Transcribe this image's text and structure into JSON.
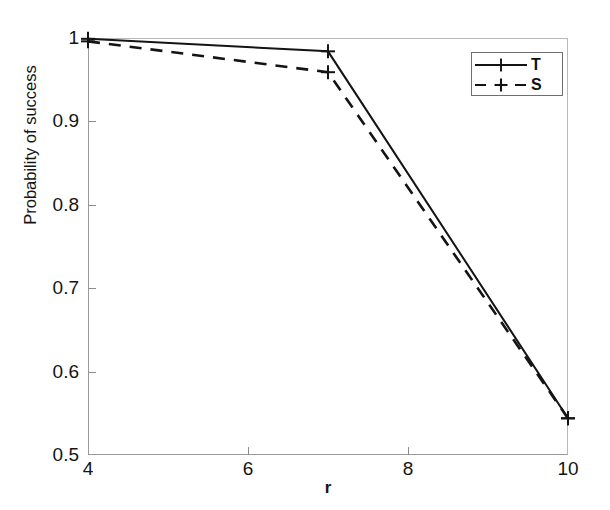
{
  "chart_data": {
    "type": "line",
    "title": "",
    "xlabel": "r",
    "ylabel": "Probability of success",
    "xlim": [
      4,
      10
    ],
    "ylim": [
      0.5,
      1.0
    ],
    "xticks": [
      4,
      6,
      8,
      10
    ],
    "xtick_labels": [
      "4",
      "6",
      "8",
      "10"
    ],
    "yticks": [
      0.5,
      0.6,
      0.7,
      0.8,
      0.9,
      1.0
    ],
    "ytick_labels": [
      "0.5",
      "0.6",
      "0.7",
      "0.8",
      "0.9",
      "1"
    ],
    "grid": false,
    "legend_position": "upper right",
    "x": [
      4,
      7,
      10
    ],
    "series": [
      {
        "name": "T",
        "label": "T",
        "linestyle": "solid",
        "marker": "plus",
        "color": "#141414",
        "values": [
          0.999,
          0.984,
          0.544
        ]
      },
      {
        "name": "S",
        "label": "S",
        "linestyle": "dashed",
        "marker": "plus",
        "color": "#141414",
        "values": [
          0.996,
          0.959,
          0.544
        ]
      }
    ]
  },
  "legend": {
    "entries": [
      {
        "label": "T",
        "style": "solid"
      },
      {
        "label": "S",
        "style": "dashed"
      }
    ]
  },
  "axes": {
    "x_title": "r",
    "y_title": "Probability of success"
  }
}
